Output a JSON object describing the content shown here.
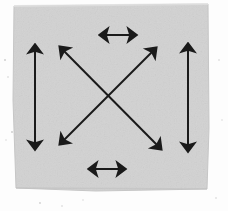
{
  "figure": {
    "canvas": {
      "width": 228,
      "height": 211
    },
    "background": {
      "name": "outer-background",
      "color": "#fdfdfd"
    },
    "panel": {
      "name": "gray-paper-square",
      "fill": "#d2d2d2",
      "edge_shade": "#c6c6c6",
      "points": "14,6 208,4 209,128 207,189 96,191 16,188 13,100",
      "left": 13,
      "top": 4,
      "right": 209,
      "bottom": 191
    },
    "arrow_style": {
      "color": "#1a1a1a",
      "stroke_width": 2.0,
      "head_length": 11,
      "head_width": 9,
      "double_headed": true
    },
    "arrows": [
      {
        "name": "left-vertical-arrow",
        "orientation": "vertical",
        "x1": 35,
        "y1": 45,
        "x2": 35,
        "y2": 149,
        "length_px": 104
      },
      {
        "name": "right-vertical-arrow",
        "orientation": "vertical",
        "x1": 188,
        "y1": 44,
        "x2": 188,
        "y2": 151,
        "length_px": 107
      },
      {
        "name": "top-horizontal-arrow",
        "orientation": "horizontal",
        "x1": 100,
        "y1": 35,
        "x2": 136,
        "y2": 35,
        "length_px": 36
      },
      {
        "name": "bottom-horizontal-arrow",
        "orientation": "horizontal",
        "x1": 89,
        "y1": 169,
        "x2": 125,
        "y2": 169,
        "length_px": 36
      },
      {
        "name": "diagonal-arrow-nwse",
        "orientation": "diagonal-down-right",
        "x1": 60,
        "y1": 47,
        "x2": 161,
        "y2": 149,
        "length_px": 144
      },
      {
        "name": "diagonal-arrow-nesw",
        "orientation": "diagonal-down-left",
        "x1": 156,
        "y1": 48,
        "x2": 60,
        "y2": 144,
        "length_px": 136
      }
    ],
    "crossing_point": {
      "x": 110,
      "y": 96
    },
    "speckles": [
      {
        "x": 5,
        "y": 60,
        "r": 1.0
      },
      {
        "x": 8,
        "y": 77,
        "r": 0.8
      },
      {
        "x": 12,
        "y": 132,
        "r": 1.0
      },
      {
        "x": 6,
        "y": 140,
        "r": 0.7
      },
      {
        "x": 40,
        "y": 203,
        "r": 0.9
      },
      {
        "x": 62,
        "y": 206,
        "r": 0.8
      },
      {
        "x": 83,
        "y": 200,
        "r": 0.7
      },
      {
        "x": 219,
        "y": 60,
        "r": 0.8
      },
      {
        "x": 222,
        "y": 120,
        "r": 0.7
      },
      {
        "x": 216,
        "y": 198,
        "r": 0.8
      }
    ]
  }
}
